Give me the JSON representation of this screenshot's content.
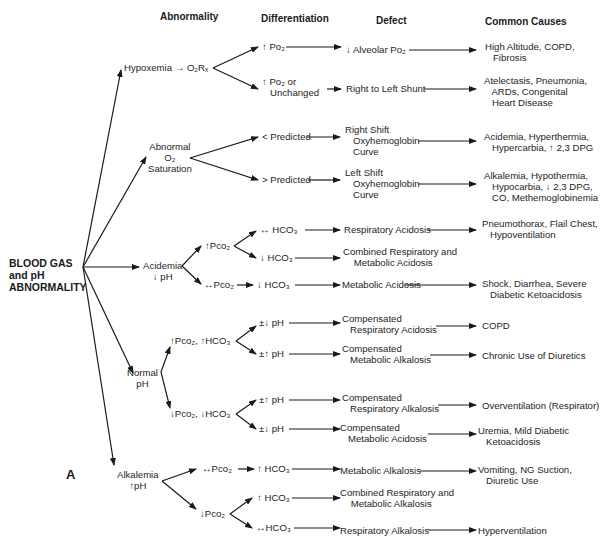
{
  "headers": {
    "abnormality": "Abnormality",
    "differentiation": "Differentiation",
    "defect": "Defect",
    "causes": "Common Causes"
  },
  "root": "BLOOD GAS\nand pH\nABNORMALITY",
  "panel_label": "A",
  "abnormality": {
    "hypoxemia": "Hypoxemia → O₂Rₓ",
    "o2sat": "Abnormal\nO₂\nSaturation",
    "acidemia": "Acidemia\n↓ pH",
    "normal": "Normal\npH",
    "alkalemia": "Alkalemia\n↑pH"
  },
  "differentiation": {
    "po2_up": "↑ Po₂",
    "po2_unch": "↑ Po₂ or\n   Unchanged",
    "pred_lt": "< Predicted",
    "pred_gt": "> Predicted",
    "acid_pco2_up": "↑Pco₂",
    "acid_hco3_eq": "↔ HCO₃",
    "acid_hco3_dn": "↓ HCO₃",
    "acid_pco2_eq": "↔Pco₂",
    "acid_hco3_dn2": "↓ HCO₃",
    "norm_up": "↑Pco₂, ↑HCO₃",
    "norm_up_ph_dn": "±↓ pH",
    "norm_up_ph_up": "±↑ pH",
    "norm_dn": "↓Pco₂, ↓HCO₃",
    "norm_dn_ph_up": "±↑ pH",
    "norm_dn_ph_dn": "±↓ pH",
    "alk_pco2_eq": "↔Pco₂",
    "alk_hco3_up": "↑ HCO₃",
    "alk_pco2_dn": "↓Pco₂",
    "alk_hco3_up2": "↑ HCO₃",
    "alk_hco3_eq": "↔HCO₃"
  },
  "defects": {
    "d1": "↓ Alveolar Po₂",
    "d2": "Right to Left Shunt",
    "d3": "Right Shift\n   Oxyhemoglobin\n   Curve",
    "d4": "Left Shift\n   Oxyhemoglobin\n   Curve",
    "d5": "Respiratory Acidosis",
    "d6": "Combined Respiratory and\n    Metabolic Acidosis",
    "d7": "Metabolic Acidosis",
    "d8": "Compensated\n   Respiratory Acidosis",
    "d9": "Compensated\n   Metabolic Alkalosis",
    "d10": "Compensated\n   Respiratory Alkalosis",
    "d11": "Compensated\n   Metabolic Acidosis",
    "d12": "Metabolic Alkalosis",
    "d13": "Combined Respiratory and\n    Metabolic Alkalosis",
    "d14": "Respiratory Alkalosis"
  },
  "causes": {
    "c1": "High Altitude, COPD,\n   Fibrosis",
    "c2": "Atelectasis, Pneumonia,\n   ARDs, Congenital\n   Heart Disease",
    "c3": "Acidemia, Hyperthermia,\n   Hypercarbia, ↑ 2,3 DPG",
    "c4": "Alkalemia, Hypothermia,\n   Hypocarbia, ↓ 2,3 DPG,\n   CO, Methemoglobinemia",
    "c5": "Pneumothorax, Flail Chest,\n   Hypoventilation",
    "c7": "Shock, Diarrhea, Severe\n   Diabetic Ketoacidosis",
    "c8": "COPD",
    "c9": "Chronic Use of Diuretics",
    "c10": "Overventilation (Respirator)",
    "c11": "Uremia, Mild Diabetic\n   Ketoacidosis",
    "c12": "Vomiting, NG Suction,\n   Diuretic Use",
    "c14": "Hyperventilation"
  }
}
